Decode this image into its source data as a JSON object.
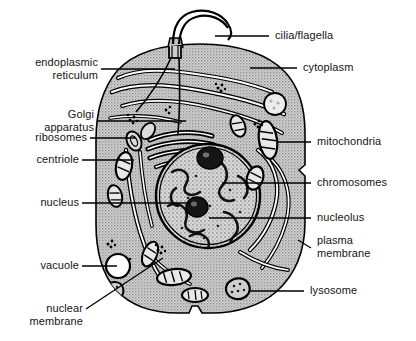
{
  "diagram": {
    "style": {
      "cytoplasm_fill": "#c9c9c9",
      "stroke": "#000000",
      "background": "#ffffff",
      "text_color": "#141414"
    }
  },
  "labels": {
    "endoplasmic_reticulum": "endoplasmic\nreticulum",
    "golgi_apparatus": "Golgi\napparatus",
    "ribosomes": "ribosomes",
    "centriole": "centriole",
    "nucleus": "nucleus",
    "vacuole": "vacuole",
    "nuclear_membrane": "nuclear\nmembrane",
    "cilia_flagella": "cilia/flagella",
    "cytoplasm": "cytoplasm",
    "mitochondria": "mitochondria",
    "chromosomes": "chromosomes",
    "nucleolus": "nucleolus",
    "plasma_membrane": "plasma\nmembrane",
    "lysosome": "lysosome"
  },
  "structures": [
    {
      "name": "endoplasmic-reticulum",
      "side": "left"
    },
    {
      "name": "golgi-apparatus",
      "side": "left"
    },
    {
      "name": "ribosomes",
      "side": "left"
    },
    {
      "name": "centriole",
      "side": "left"
    },
    {
      "name": "nucleus",
      "side": "left"
    },
    {
      "name": "vacuole",
      "side": "left"
    },
    {
      "name": "nuclear-membrane",
      "side": "left"
    },
    {
      "name": "cilia-flagella",
      "side": "right"
    },
    {
      "name": "cytoplasm",
      "side": "right"
    },
    {
      "name": "mitochondria",
      "side": "right"
    },
    {
      "name": "chromosomes",
      "side": "right"
    },
    {
      "name": "nucleolus",
      "side": "right"
    },
    {
      "name": "plasma-membrane",
      "side": "right"
    },
    {
      "name": "lysosome",
      "side": "right"
    }
  ]
}
